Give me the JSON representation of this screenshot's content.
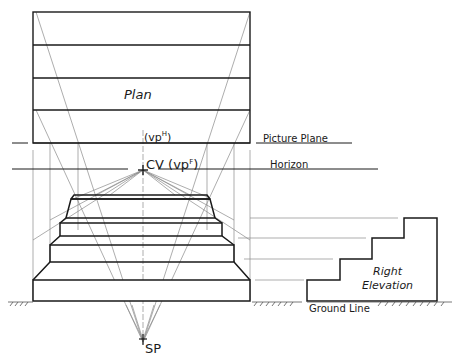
{
  "diagram": {
    "type": "perspective-projection",
    "labels": {
      "plan": "Plan",
      "vp_h": "(vp",
      "vp_h_sup": "H",
      "vp_h_close": ")",
      "picture_plane": "Picture Plane",
      "cv": "CV (vp",
      "cv_sup": "F",
      "cv_close": ")",
      "horizon": "Horizon",
      "right_elevation_line1": "Right",
      "right_elevation_line2": "Elevation",
      "ground_line": "Ground Line",
      "sp": "SP"
    },
    "colors": {
      "ink": "#1a1a1a",
      "construction": "#8a8a8a",
      "background": "#ffffff"
    }
  }
}
